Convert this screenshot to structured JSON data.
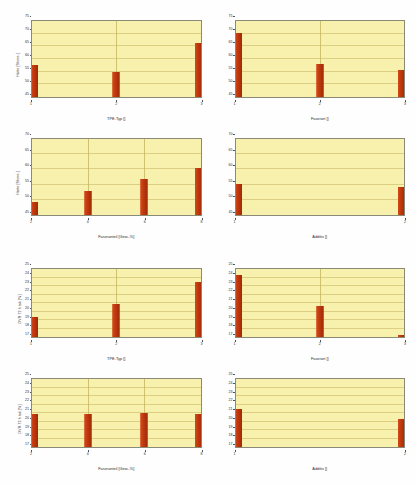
{
  "page": {
    "background_color": "#fefefe",
    "bar_color": "#bf370d",
    "plot_background_color": "#f8f1ae",
    "axis_color": "#8a8a78"
  },
  "chart_data": [
    {
      "type": "bar",
      "title": "",
      "panel_id": "haerte-tpe-typ",
      "xlabel": "TPE-Typ []",
      "ylabel": "Härte [Shore-]",
      "categories": [
        "1",
        "2",
        "3"
      ],
      "values": [
        57.5,
        55.0,
        66.3
      ],
      "ylim": [
        45,
        75
      ],
      "yticks": [
        45,
        50,
        55,
        60,
        65,
        70,
        75
      ],
      "grid": true,
      "legend": "none"
    },
    {
      "type": "bar",
      "title": "",
      "panel_id": "haerte-faserart",
      "xlabel": "Faserart []",
      "ylabel": "",
      "categories": [
        "1",
        "2",
        "3"
      ],
      "values": [
        70.2,
        58.0,
        55.5
      ],
      "ylim": [
        45,
        75
      ],
      "yticks": [
        45,
        50,
        55,
        60,
        65,
        70,
        75
      ],
      "grid": true,
      "legend": "none"
    },
    {
      "type": "bar",
      "title": "",
      "panel_id": "haerte-faseranteil",
      "xlabel": "Faseranteil [Gew.-%]",
      "ylabel": "Härte [Shore-]",
      "categories": [
        "2",
        "4",
        "6",
        "8"
      ],
      "values": [
        49.3,
        53.0,
        57.0,
        60.5
      ],
      "ylim": [
        45,
        70
      ],
      "yticks": [
        45,
        50,
        55,
        60,
        65,
        70
      ],
      "grid": true,
      "legend": "none"
    },
    {
      "type": "bar",
      "title": "",
      "panel_id": "haerte-additiv",
      "xlabel": "Additiv []",
      "ylabel": "",
      "categories": [
        "1",
        "2"
      ],
      "values": [
        55.2,
        54.3
      ],
      "ylim": [
        45,
        70
      ],
      "yticks": [
        45,
        50,
        55,
        60,
        65,
        70
      ],
      "grid": true,
      "legend": "none"
    },
    {
      "type": "bar",
      "title": "",
      "panel_id": "dvr-tpe-typ",
      "xlabel": "TPE-Typ []",
      "ylabel": "DVR 72 h tsk [%]",
      "categories": [
        "1",
        "2",
        "3"
      ],
      "values": [
        19.3,
        20.9,
        23.5
      ],
      "ylim": [
        17,
        25
      ],
      "yticks": [
        17,
        18,
        19,
        20,
        21,
        22,
        23,
        24,
        25
      ],
      "grid": true,
      "legend": "none"
    },
    {
      "type": "bar",
      "title": "",
      "panel_id": "dvr-faserart",
      "xlabel": "Faserart []",
      "ylabel": "",
      "categories": [
        "1",
        "2",
        "3"
      ],
      "values": [
        24.3,
        20.6,
        17.2
      ],
      "ylim": [
        17,
        25
      ],
      "yticks": [
        17,
        18,
        19,
        20,
        21,
        22,
        23,
        24,
        25
      ],
      "grid": true,
      "legend": "none"
    },
    {
      "type": "bar",
      "title": "",
      "panel_id": "dvr-faseranteil",
      "xlabel": "Faseranteil [Gew.-%]",
      "ylabel": "DVR 72 h tsk [%]",
      "categories": [
        "2",
        "4",
        "6",
        "8"
      ],
      "values": [
        20.9,
        20.9,
        21.0,
        20.9
      ],
      "ylim": [
        17,
        25
      ],
      "yticks": [
        17,
        18,
        19,
        20,
        21,
        22,
        23,
        24,
        25
      ],
      "grid": true,
      "legend": "none"
    },
    {
      "type": "bar",
      "title": "",
      "panel_id": "dvr-additiv",
      "xlabel": "Additiv []",
      "ylabel": "",
      "categories": [
        "1",
        "2"
      ],
      "values": [
        21.5,
        20.3
      ],
      "ylim": [
        17,
        25
      ],
      "yticks": [
        17,
        18,
        19,
        20,
        21,
        22,
        23,
        24,
        25
      ],
      "grid": true,
      "legend": "none"
    }
  ]
}
